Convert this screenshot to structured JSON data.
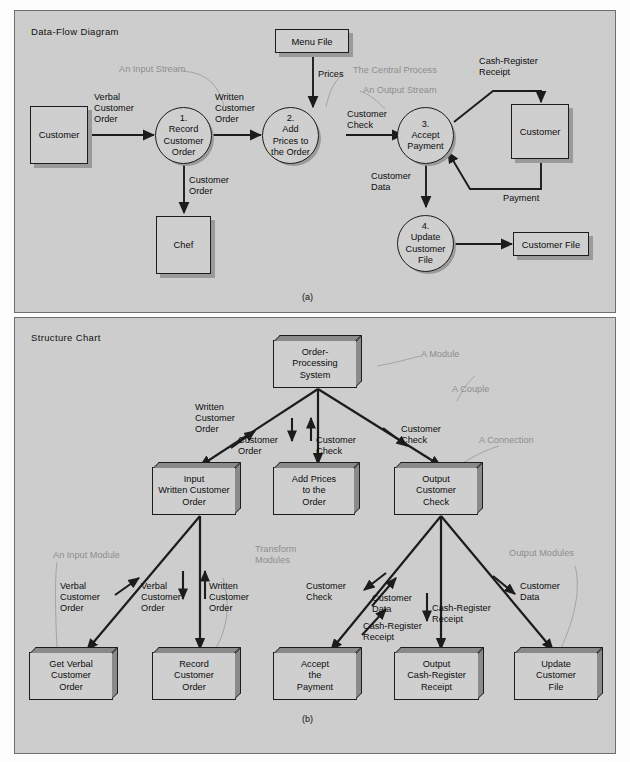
{
  "figure": {
    "panel_a": {
      "title": "Data-Flow Diagram",
      "caption": "(a)",
      "entities": [
        {
          "name": "customer-left",
          "label": "Customer"
        },
        {
          "name": "chef",
          "label": "Chef"
        },
        {
          "name": "customer-right",
          "label": "Customer"
        }
      ],
      "stores": [
        {
          "name": "menu-file",
          "label": "Menu File"
        },
        {
          "name": "customer-file",
          "label": "Customer File"
        }
      ],
      "processes": [
        {
          "name": "process-1",
          "number": "1.",
          "label": "Record\nCustomer\nOrder"
        },
        {
          "name": "process-2",
          "number": "2.",
          "label": "Add\nPrices to\nthe Order"
        },
        {
          "name": "process-3",
          "number": "3.",
          "label": "Accept\nPayment"
        },
        {
          "name": "process-4",
          "number": "4.",
          "label": "Update\nCustomer\nFile"
        }
      ],
      "flows": [
        {
          "name": "flow-verbal-customer-order",
          "label": "Verbal\nCustomer\nOrder"
        },
        {
          "name": "flow-written-customer-order",
          "label": "Written\nCustomer\nOrder"
        },
        {
          "name": "flow-customer-order",
          "label": "Customer\nOrder"
        },
        {
          "name": "flow-prices",
          "label": "Prices"
        },
        {
          "name": "flow-customer-check",
          "label": "Customer\nCheck"
        },
        {
          "name": "flow-cash-register-receipt",
          "label": "Cash-Register\nReceipt"
        },
        {
          "name": "flow-payment",
          "label": "Payment"
        },
        {
          "name": "flow-customer-data",
          "label": "Customer\nData"
        }
      ],
      "annotations": [
        {
          "name": "annotation-input-stream",
          "label": "An Input Stream"
        },
        {
          "name": "annotation-central-process",
          "label": "The Central Process"
        },
        {
          "name": "annotation-output-stream",
          "label": "An Output Stream"
        }
      ]
    },
    "panel_b": {
      "title": "Structure Chart",
      "caption": "(b)",
      "modules": [
        {
          "name": "module-order-processing-system",
          "label": "Order-\nProcessing\nSystem"
        },
        {
          "name": "module-input-written-customer-order",
          "label": "Input\nWritten Customer\nOrder"
        },
        {
          "name": "module-add-prices-to-the-order",
          "label": "Add Prices\nto the\nOrder"
        },
        {
          "name": "module-output-customer-check",
          "label": "Output\nCustomer\nCheck"
        },
        {
          "name": "module-get-verbal-customer-order",
          "label": "Get Verbal\nCustomer\nOrder"
        },
        {
          "name": "module-record-customer-order",
          "label": "Record\nCustomer\nOrder"
        },
        {
          "name": "module-accept-the-payment",
          "label": "Accept\nthe\nPayment"
        },
        {
          "name": "module-output-cash-register-receipt",
          "label": "Output\nCash-Register\nReceipt"
        },
        {
          "name": "module-update-customer-file",
          "label": "Update\nCustomer\nFile"
        }
      ],
      "couples": [
        {
          "name": "couple-written-customer-order-top",
          "label": "Written\nCustomer\nOrder"
        },
        {
          "name": "couple-customer-order-top",
          "label": "Customer\nOrder"
        },
        {
          "name": "couple-customer-check-top",
          "label": "Customer\nCheck"
        },
        {
          "name": "couple-customer-check-right",
          "label": "Customer\nCheck"
        },
        {
          "name": "couple-verbal-customer-order-a",
          "label": "Verbal\nCustomer\nOrder"
        },
        {
          "name": "couple-verbal-customer-order-b",
          "label": "Verbal\nCustomer\nOrder"
        },
        {
          "name": "couple-written-customer-order-b",
          "label": "Written\nCustomer\nOrder"
        },
        {
          "name": "couple-customer-check-low",
          "label": "Customer\nCheck"
        },
        {
          "name": "couple-customer-data-a",
          "label": "Customer\nData"
        },
        {
          "name": "couple-cash-register-receipt-a",
          "label": "Cash-Register\nReceipt"
        },
        {
          "name": "couple-cash-register-receipt-b",
          "label": "Cash-Register\nReceipt"
        },
        {
          "name": "couple-customer-data-b",
          "label": "Customer\nData"
        }
      ],
      "annotations": [
        {
          "name": "annotation-a-module",
          "label": "A Module"
        },
        {
          "name": "annotation-a-couple",
          "label": "A Couple"
        },
        {
          "name": "annotation-a-connection",
          "label": "A Connection"
        },
        {
          "name": "annotation-an-input-module",
          "label": "An Input Module"
        },
        {
          "name": "annotation-transform-modules",
          "label": "Transform\nModules"
        },
        {
          "name": "annotation-output-modules",
          "label": "Output Modules"
        }
      ]
    }
  },
  "colors": {
    "panel_background": "#cdcdcd",
    "page_background": "#fdfdfd",
    "ink": "#1c1c1c",
    "annotation": "#8d8d8d",
    "shadow": "#9a9a9a"
  }
}
